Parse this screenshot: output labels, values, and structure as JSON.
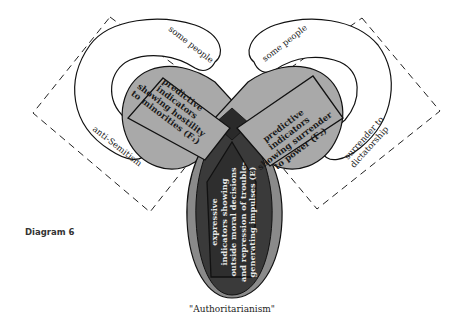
{
  "caption": "Diagram 6",
  "bottom_label": "\"Authoritarianism\"",
  "left_lobe": {
    "outer_top_label": "some people",
    "outer_side_label": "anti-Semitism",
    "inner_box_lines": [
      "predictive",
      "indicators",
      "showing hostility",
      "to minorities (F₁)"
    ]
  },
  "right_lobe": {
    "outer_top_label": "some people",
    "outer_side_label_lines": [
      "surrender to",
      "dictatorship"
    ],
    "inner_box_lines": [
      "predictive",
      "indicators",
      "showing surrender",
      "to power (F₂)"
    ]
  },
  "center_lobe": {
    "inner_box_lines": [
      "expressive",
      "indicators showing",
      "outside moral decisions",
      "and repression of trouble-",
      "generating impulses (E)"
    ]
  },
  "colors": {
    "light_gray_fill": "#a9a9a9",
    "dark_fill": "#3a3a3a",
    "overlap_fill": "#2a2a2a",
    "line": "#111111",
    "background": "#ffffff"
  }
}
